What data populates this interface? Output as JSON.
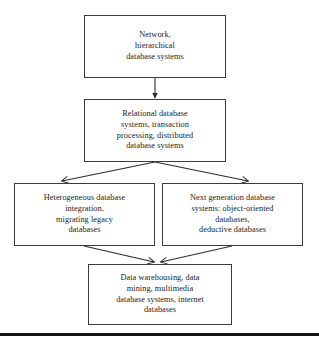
{
  "figure": {
    "type": "flowchart",
    "orientation": "top-to-bottom",
    "background_color": "#ffffff",
    "box_border_color": "#3b3b3b",
    "text_color": "#1c1c1c",
    "arrow_color": "#2b2b2b"
  },
  "nodes": {
    "legacy": {
      "id": "legacy-systems",
      "text": "Network,\nhierarchical\ndatabase systems",
      "lines": [
        "Network,",
        "hierarchical",
        "database systems"
      ],
      "row": 1
    },
    "relational": {
      "id": "relational-systems",
      "text": "Relational database\nsystems, transaction\nprocessing, distributed\ndatabase systems",
      "lines": [
        "Relational database",
        "systems, transaction",
        "processing, distributed",
        "database systems"
      ],
      "row": 2
    },
    "heterogeneous": {
      "id": "heterogeneous-systems",
      "text": "Heterogeneous database\nintegration,\nmigrating legacy\ndatabases",
      "lines": [
        "Heterogeneous database",
        "integration,",
        "migrating legacy",
        "databases"
      ],
      "row": 3
    },
    "nextgen": {
      "id": "next-generation-systems",
      "text": "Next generation database\nsystems: object-oriented\ndatabases,\ndeductive databases",
      "lines": [
        "Next generation database",
        "systems: object-oriented",
        "databases,",
        "deductive databases"
      ],
      "row": 3
    },
    "warehousing": {
      "id": "data-warehousing-systems",
      "text": "Data warehousing, data\nmining, multimedia\ndatabase  systems, internet\ndatabases",
      "lines": [
        "Data warehousing, data",
        "mining, multimedia",
        "database  systems, internet",
        "databases"
      ],
      "row": 4
    }
  },
  "edges": [
    {
      "from": "legacy",
      "to": "relational",
      "style": "straight-down",
      "arrowhead": "filled"
    },
    {
      "from": "relational",
      "to": "heterogeneous",
      "style": "diagonal-left",
      "arrowhead": "open"
    },
    {
      "from": "relational",
      "to": "nextgen",
      "style": "diagonal-right",
      "arrowhead": "open"
    },
    {
      "from": "heterogeneous",
      "to": "warehousing",
      "style": "diagonal-right",
      "arrowhead": "open"
    },
    {
      "from": "nextgen",
      "to": "warehousing",
      "style": "diagonal-left",
      "arrowhead": "open"
    }
  ],
  "footer": {
    "rule_color": "#141414"
  }
}
